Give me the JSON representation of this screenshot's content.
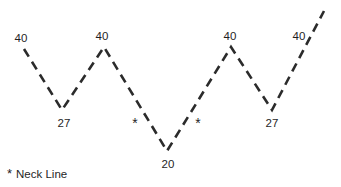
{
  "chart_data": {
    "type": "line",
    "title": "",
    "subtitle": "",
    "xlabel": "",
    "ylabel": "",
    "grid": false,
    "legend_position": "bottom-left",
    "xlim": [
      0,
      341
    ],
    "ylim": [
      0,
      50
    ],
    "line_style": "dashed",
    "line_color": "#2b2b2b",
    "annotations": [
      {
        "name": "neck-line-marker-left",
        "label": "*",
        "x": 135,
        "y": 123
      },
      {
        "name": "neck-line-marker-right",
        "label": "*",
        "x": 198,
        "y": 123
      }
    ],
    "legend": [
      {
        "symbol": "*",
        "label": "Neck Line"
      }
    ],
    "points": [
      {
        "label": "40",
        "value": 40,
        "x": 24,
        "y": 49,
        "label_x": 21,
        "label_y": 39,
        "kind": "start"
      },
      {
        "label": "27",
        "value": 27,
        "x": 62,
        "y": 110,
        "label_x": 64,
        "label_y": 124,
        "kind": "trough"
      },
      {
        "label": "40",
        "value": 40,
        "x": 104,
        "y": 47,
        "label_x": 102,
        "label_y": 37,
        "kind": "peak"
      },
      {
        "label": "20",
        "value": 20,
        "x": 167,
        "y": 151,
        "label_x": 168,
        "label_y": 165,
        "kind": "trough"
      },
      {
        "label": "40",
        "value": 40,
        "x": 231,
        "y": 47,
        "label_x": 230,
        "label_y": 37,
        "kind": "peak"
      },
      {
        "label": "27",
        "value": 27,
        "x": 272,
        "y": 110,
        "label_x": 272,
        "label_y": 124,
        "kind": "trough"
      },
      {
        "label": "40",
        "value": 40,
        "x": 324,
        "y": 11,
        "label_x": 299,
        "label_y": 37,
        "kind": "end"
      }
    ],
    "path": "M24,49 L62,110 L104,47 L167,151 L231,47 L272,110 L324,11"
  },
  "legend_entry": {
    "star": "*",
    "text": "Neck Line"
  },
  "labels": {
    "p0": "40",
    "p1": "27",
    "p2": "40",
    "p3": "20",
    "p4": "40",
    "p5": "27",
    "p6": "40",
    "star_left": "*",
    "star_right": "*"
  }
}
